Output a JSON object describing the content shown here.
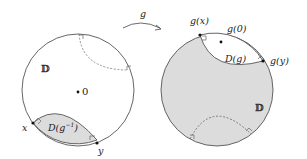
{
  "diagram": {
    "type": "hyperbolic-disk-map",
    "colors": {
      "stroke": "#555555",
      "fill_shaded": "#dcdcdc",
      "background": "#ffffff",
      "point": "#111111"
    },
    "arrow": {
      "label": "g"
    },
    "left_disk": {
      "disk_label": "𝔻",
      "origin_label": "0",
      "region_label": "D(g",
      "region_sup": "−1",
      "region_close": ")",
      "point_x_label": "x",
      "point_y_label": "y"
    },
    "right_disk": {
      "disk_label": "𝔻",
      "gx_label": "g(x)",
      "g0_label": "g(0)",
      "gy_label": "g(y)",
      "region_label": "D(g)"
    }
  }
}
